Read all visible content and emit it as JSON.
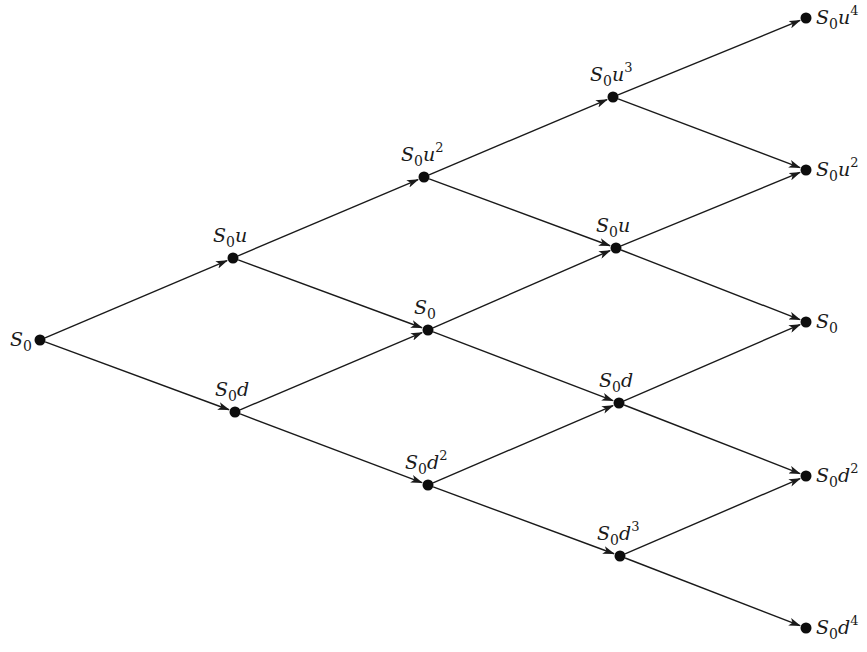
{
  "diagram": {
    "type": "binomial-tree",
    "steps": 4,
    "nodes": [
      {
        "id": "n00",
        "x": 40,
        "y": 340,
        "base": "S",
        "sub": "0",
        "factor": "",
        "exp": "",
        "label_pos": "left"
      },
      {
        "id": "n11",
        "x": 233,
        "y": 258,
        "base": "S",
        "sub": "0",
        "factor": "u",
        "exp": "",
        "label_pos": "above"
      },
      {
        "id": "n10",
        "x": 235,
        "y": 412,
        "base": "S",
        "sub": "0",
        "factor": "d",
        "exp": "",
        "label_pos": "above"
      },
      {
        "id": "n22",
        "x": 424,
        "y": 177,
        "base": "S",
        "sub": "0",
        "factor": "u",
        "exp": "2",
        "label_pos": "above"
      },
      {
        "id": "n21",
        "x": 428,
        "y": 330,
        "base": "S",
        "sub": "0",
        "factor": "",
        "exp": "",
        "label_pos": "above"
      },
      {
        "id": "n20",
        "x": 428,
        "y": 485,
        "base": "S",
        "sub": "0",
        "factor": "d",
        "exp": "2",
        "label_pos": "above"
      },
      {
        "id": "n33",
        "x": 613,
        "y": 97,
        "base": "S",
        "sub": "0",
        "factor": "u",
        "exp": "3",
        "label_pos": "above"
      },
      {
        "id": "n32",
        "x": 616,
        "y": 248,
        "base": "S",
        "sub": "0",
        "factor": "u",
        "exp": "",
        "label_pos": "above"
      },
      {
        "id": "n31",
        "x": 619,
        "y": 403,
        "base": "S",
        "sub": "0",
        "factor": "d",
        "exp": "",
        "label_pos": "above"
      },
      {
        "id": "n30",
        "x": 620,
        "y": 556,
        "base": "S",
        "sub": "0",
        "factor": "d",
        "exp": "3",
        "label_pos": "above"
      },
      {
        "id": "n44",
        "x": 806,
        "y": 18,
        "base": "S",
        "sub": "0",
        "factor": "u",
        "exp": "4",
        "label_pos": "right"
      },
      {
        "id": "n43",
        "x": 806,
        "y": 170,
        "base": "S",
        "sub": "0",
        "factor": "u",
        "exp": "2",
        "label_pos": "right"
      },
      {
        "id": "n42",
        "x": 806,
        "y": 322,
        "base": "S",
        "sub": "0",
        "factor": "",
        "exp": "",
        "label_pos": "right"
      },
      {
        "id": "n41",
        "x": 806,
        "y": 476,
        "base": "S",
        "sub": "0",
        "factor": "d",
        "exp": "2",
        "label_pos": "right"
      },
      {
        "id": "n40",
        "x": 806,
        "y": 628,
        "base": "S",
        "sub": "0",
        "factor": "d",
        "exp": "4",
        "label_pos": "right"
      }
    ],
    "edges": [
      [
        "n00",
        "n11"
      ],
      [
        "n00",
        "n10"
      ],
      [
        "n11",
        "n22"
      ],
      [
        "n11",
        "n21"
      ],
      [
        "n10",
        "n21"
      ],
      [
        "n10",
        "n20"
      ],
      [
        "n22",
        "n33"
      ],
      [
        "n22",
        "n32"
      ],
      [
        "n21",
        "n32"
      ],
      [
        "n21",
        "n31"
      ],
      [
        "n20",
        "n31"
      ],
      [
        "n20",
        "n30"
      ],
      [
        "n33",
        "n44"
      ],
      [
        "n33",
        "n43"
      ],
      [
        "n32",
        "n43"
      ],
      [
        "n32",
        "n42"
      ],
      [
        "n31",
        "n42"
      ],
      [
        "n31",
        "n41"
      ],
      [
        "n30",
        "n41"
      ],
      [
        "n30",
        "n40"
      ]
    ],
    "labels_text": [
      "S0",
      "S0u",
      "S0d",
      "S0u^2",
      "S0",
      "S0d^2",
      "S0u^3",
      "S0u",
      "S0d",
      "S0d^3",
      "S0u^4",
      "S0u^2",
      "S0",
      "S0d^2",
      "S0d^4"
    ]
  }
}
